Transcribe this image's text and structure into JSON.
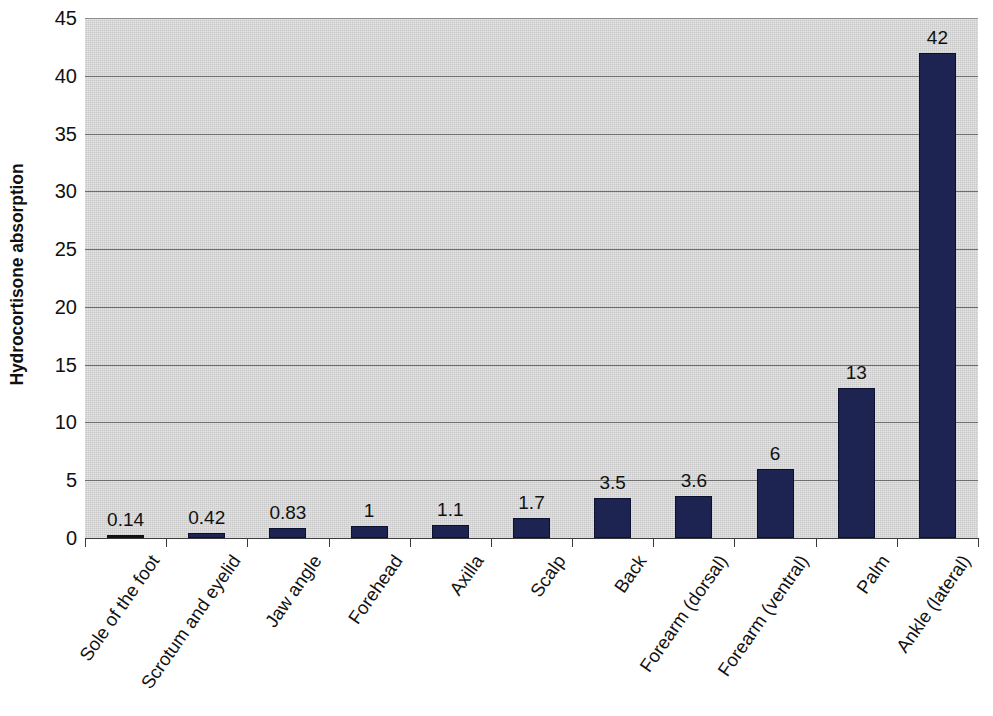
{
  "chart_data": {
    "type": "bar",
    "title": "",
    "subtitle": "",
    "xlabel": "",
    "ylabel": "Hydrocortisone absorption",
    "ylim": [
      0,
      45
    ],
    "ytick_interval": 5,
    "ytick_labels": [
      "0",
      "5",
      "10",
      "15",
      "20",
      "25",
      "30",
      "35",
      "40",
      "45"
    ],
    "grid": true,
    "legend": "none",
    "bar_color": "#1e2452",
    "plot_background": "#c9c9c9",
    "categories": [
      "Sole of the foot",
      "Scrotum and eyelid",
      "Jaw angle",
      "Forehead",
      "Axilla",
      "Scalp",
      "Back",
      "Forearm (dorsal)",
      "Forearm (ventral)",
      "Palm",
      "Ankle (lateral)"
    ],
    "values": [
      0.14,
      0.42,
      0.83,
      1,
      1.1,
      1.7,
      3.5,
      3.6,
      6,
      13,
      42
    ],
    "value_labels": [
      "0.14",
      "0.42",
      "0.83",
      "1",
      "1.1",
      "1.7",
      "3.5",
      "3.6",
      "6",
      "13",
      "42"
    ]
  }
}
